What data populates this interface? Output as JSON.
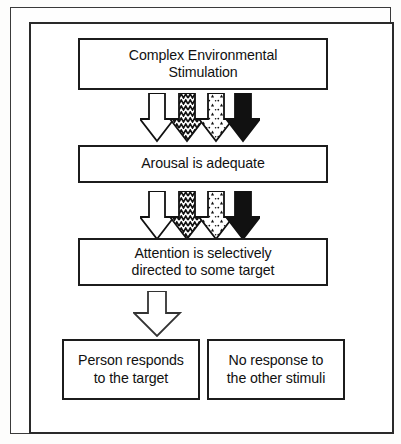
{
  "diagram": {
    "frame": {
      "style": "double-rule-border",
      "color": "#2a2a2a"
    },
    "boxes": [
      {
        "id": "stimulation",
        "line1": "Complex Environmental",
        "line2": "Stimulation"
      },
      {
        "id": "arousal",
        "line1": "Arousal is adequate",
        "line2": ""
      },
      {
        "id": "attention",
        "line1": "Attention is selectively",
        "line2": "directed to some target"
      },
      {
        "id": "responds",
        "line1": "Person responds",
        "line2": "to the target"
      },
      {
        "id": "noresponse",
        "line1": "No response to",
        "line2": "the other stimuli"
      }
    ],
    "arrow_groups": [
      {
        "id": "arrows-stimulation-to-arousal",
        "count": 4,
        "arrows": [
          {
            "name": "arrow-down-outline",
            "fill": "#ffffff",
            "pattern": "none"
          },
          {
            "name": "arrow-down-zigzag",
            "fill": "#ffffff",
            "pattern": "zigzag"
          },
          {
            "name": "arrow-down-speckled",
            "fill": "#ffffff",
            "pattern": "speckle"
          },
          {
            "name": "arrow-down-solid",
            "fill": "#111111",
            "pattern": "solid"
          }
        ]
      },
      {
        "id": "arrows-arousal-to-attention",
        "count": 4,
        "arrows": [
          {
            "name": "arrow-down-outline",
            "fill": "#ffffff",
            "pattern": "none"
          },
          {
            "name": "arrow-down-zigzag",
            "fill": "#ffffff",
            "pattern": "zigzag"
          },
          {
            "name": "arrow-down-speckled",
            "fill": "#ffffff",
            "pattern": "speckle"
          },
          {
            "name": "arrow-down-solid",
            "fill": "#111111",
            "pattern": "solid"
          }
        ]
      }
    ],
    "single_arrow": {
      "id": "arrow-attention-to-response",
      "name": "arrow-down-outline",
      "fill": "#ffffff"
    },
    "colors": {
      "ink": "#111111",
      "paper": "#ffffff",
      "frame": "#2a2a2a"
    }
  }
}
